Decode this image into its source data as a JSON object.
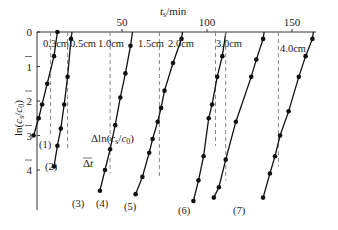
{
  "chart_data": {
    "type": "line",
    "title": "",
    "xlabel": "t_s/min",
    "ylabel": "ln(c_s/c_0)",
    "x_axis_position": "top",
    "y_axis_inverted": true,
    "xlim": [
      0,
      170
    ],
    "ylim": [
      0,
      5
    ],
    "x_ticks": [
      0,
      50,
      100,
      150
    ],
    "x_tick_labels": [
      "",
      "50",
      "100",
      "150"
    ],
    "y_ticks": [
      0,
      1,
      2,
      3,
      4
    ],
    "y_tick_labels": [
      "0",
      "1",
      "2",
      "3",
      "4"
    ],
    "grid": false,
    "legend": "inline labels",
    "annotations": [
      "Δt",
      "Δln(c_s/c_0)"
    ],
    "series": [
      {
        "name": "0.3cm",
        "id": "(1)",
        "points": [
          [
            12,
            0.0
          ],
          [
            10,
            0.7
          ],
          [
            6,
            1.5
          ],
          [
            3,
            2.1
          ],
          [
            1,
            2.5
          ],
          [
            -2,
            3.0
          ]
        ],
        "dash_x": 8,
        "dash_to": 3.0
      },
      {
        "name": "0.5cm",
        "id": "(2)",
        "points": [
          [
            20,
            0.2
          ],
          [
            18,
            1.3
          ],
          [
            16,
            2.1
          ],
          [
            14,
            2.8
          ],
          [
            12,
            3.3
          ],
          [
            10,
            3.9
          ]
        ],
        "dash_x": 18,
        "dash_to": 3.4
      },
      {
        "name": "1.0cm",
        "id": "(3)",
        "points": [
          [
            55,
            0.4
          ],
          [
            52,
            1.2
          ],
          [
            49,
            1.9
          ],
          [
            46,
            2.7
          ],
          [
            43,
            3.4
          ],
          [
            40,
            4.0
          ],
          [
            37,
            4.6
          ]
        ],
        "dash_x": 43,
        "dash_to": 4.1
      },
      {
        "name": "1.5cm",
        "id": "(4)",
        "points": [
          [
            85,
            0.2
          ],
          [
            80,
            0.9
          ],
          [
            75,
            1.7
          ],
          [
            73,
            2.2
          ],
          [
            71,
            2.6
          ],
          [
            68,
            3.1
          ],
          [
            66,
            3.5
          ],
          [
            62,
            4.2
          ],
          [
            58,
            4.7
          ]
        ],
        "dash_x": 72,
        "dash_to": 4.2
      },
      {
        "name": "2.0cm",
        "id": "(5)",
        "points": [
          [
            109,
            0.7
          ],
          [
            106,
            1.3
          ],
          [
            103,
            2.1
          ],
          [
            101,
            2.5
          ],
          [
            98,
            3.6
          ],
          [
            95,
            4.3
          ],
          [
            92,
            4.9
          ]
        ],
        "dash_x": 105,
        "dash_to": 3.3
      },
      {
        "name": "3.0cm",
        "id": "(6)",
        "points": [
          [
            133,
            0.2
          ],
          [
            129,
            0.8
          ],
          [
            126,
            1.3
          ],
          [
            117,
            2.6
          ],
          [
            111,
            3.7
          ],
          [
            107,
            4.5
          ],
          [
            104,
            4.8
          ]
        ],
        "dash_x": 111,
        "dash_to": 4.3
      },
      {
        "name": "4.0cm",
        "id": "(7)",
        "points": [
          [
            162,
            0.2
          ],
          [
            158,
            0.7
          ],
          [
            154,
            1.3
          ],
          [
            148,
            2.3
          ],
          [
            143,
            3.0
          ],
          [
            140,
            3.6
          ],
          [
            137,
            4.1
          ],
          [
            133,
            4.8
          ]
        ],
        "dash_x": 142,
        "dash_to": 3.9
      }
    ]
  },
  "labels": {
    "x_axis_title_t": "t",
    "x_axis_title_sub": "s",
    "x_axis_title_unit": "/min",
    "y_axis_title": "ln(cs/c0)",
    "delta_t": "Δt",
    "delta_ln": "Δln(cs/c0)"
  }
}
